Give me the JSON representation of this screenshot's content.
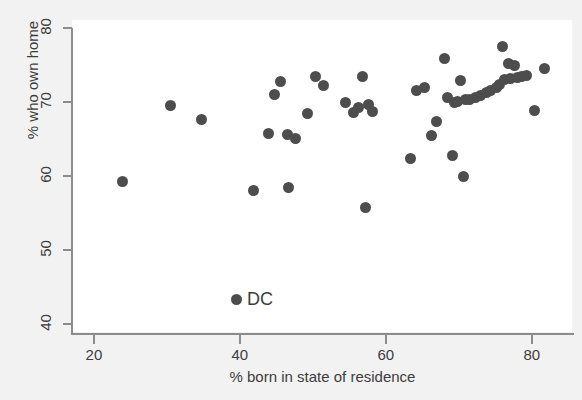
{
  "chart_data": {
    "type": "scatter",
    "title": "",
    "xlabel": "% born in state of residence",
    "ylabel": "% who own home",
    "xlim": [
      17,
      85.5
    ],
    "ylim": [
      38.9,
      81.1
    ],
    "xticks": [
      20,
      40,
      60,
      80
    ],
    "yticks": [
      40,
      50,
      60,
      70,
      80
    ],
    "grid": false,
    "legend": null,
    "marker_color": "#4d4d4d",
    "background_color": "#f2f2f2",
    "panel_color": "#ffffff",
    "axis_color": "#8c8c8c",
    "points": [
      {
        "x": 23.9,
        "y": 59.3
      },
      {
        "x": 30.5,
        "y": 69.6
      },
      {
        "x": 34.8,
        "y": 67.7
      },
      {
        "x": 41.9,
        "y": 58.0
      },
      {
        "x": 43.9,
        "y": 65.7
      },
      {
        "x": 44.8,
        "y": 71.0
      },
      {
        "x": 45.6,
        "y": 72.8
      },
      {
        "x": 46.5,
        "y": 65.6
      },
      {
        "x": 46.6,
        "y": 58.5
      },
      {
        "x": 47.6,
        "y": 65.1
      },
      {
        "x": 49.3,
        "y": 68.5
      },
      {
        "x": 50.4,
        "y": 73.5
      },
      {
        "x": 51.5,
        "y": 72.3
      },
      {
        "x": 54.5,
        "y": 70.0
      },
      {
        "x": 55.6,
        "y": 68.6
      },
      {
        "x": 56.2,
        "y": 69.2
      },
      {
        "x": 56.8,
        "y": 73.4
      },
      {
        "x": 57.2,
        "y": 55.8
      },
      {
        "x": 57.6,
        "y": 69.7
      },
      {
        "x": 58.2,
        "y": 68.7
      },
      {
        "x": 63.4,
        "y": 62.3
      },
      {
        "x": 64.2,
        "y": 71.5
      },
      {
        "x": 65.3,
        "y": 72.0
      },
      {
        "x": 66.3,
        "y": 65.5
      },
      {
        "x": 66.9,
        "y": 67.4
      },
      {
        "x": 68.1,
        "y": 75.9
      },
      {
        "x": 68.5,
        "y": 70.6
      },
      {
        "x": 69.1,
        "y": 62.8
      },
      {
        "x": 69.4,
        "y": 69.9
      },
      {
        "x": 69.8,
        "y": 70.1
      },
      {
        "x": 70.2,
        "y": 72.9
      },
      {
        "x": 70.6,
        "y": 60.0
      },
      {
        "x": 70.9,
        "y": 70.4
      },
      {
        "x": 71.5,
        "y": 70.3
      },
      {
        "x": 72.3,
        "y": 70.6
      },
      {
        "x": 73.0,
        "y": 70.9
      },
      {
        "x": 73.8,
        "y": 71.3
      },
      {
        "x": 74.4,
        "y": 71.6
      },
      {
        "x": 75.1,
        "y": 72.0
      },
      {
        "x": 75.6,
        "y": 72.4
      },
      {
        "x": 76.0,
        "y": 77.5
      },
      {
        "x": 76.2,
        "y": 73.0
      },
      {
        "x": 76.8,
        "y": 75.2
      },
      {
        "x": 77.1,
        "y": 73.2
      },
      {
        "x": 77.6,
        "y": 74.9
      },
      {
        "x": 78.1,
        "y": 73.3
      },
      {
        "x": 78.6,
        "y": 73.4
      },
      {
        "x": 79.3,
        "y": 73.6
      },
      {
        "x": 80.4,
        "y": 68.8
      },
      {
        "x": 81.8,
        "y": 74.6
      }
    ],
    "annotations": [
      {
        "label": "DC",
        "marker_x": 39.6,
        "marker_y": 43.3,
        "label_offset_x": 10,
        "label_offset_y": -10
      }
    ]
  },
  "axis": {
    "y_title": "% who own home",
    "x_title": "% born in state of residence",
    "y_tick_labels": [
      "40",
      "50",
      "60",
      "70",
      "80"
    ],
    "x_tick_labels": [
      "20",
      "40",
      "60",
      "80"
    ]
  }
}
